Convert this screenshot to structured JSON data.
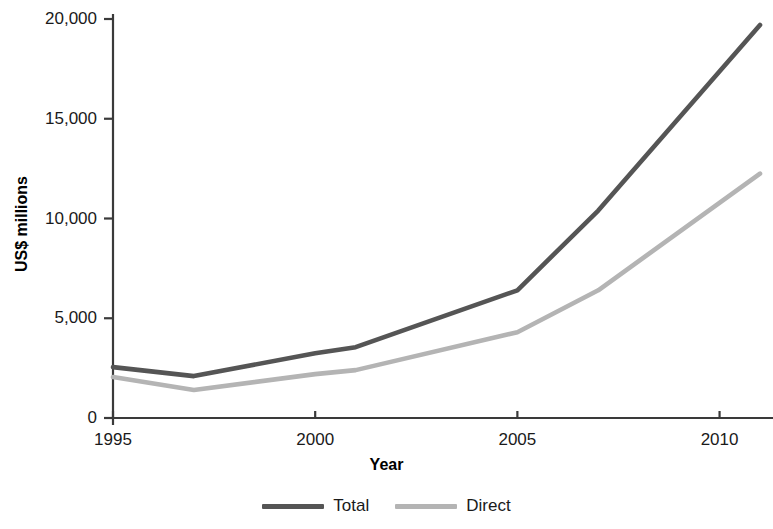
{
  "chart_data": {
    "type": "line",
    "title": "",
    "xlabel": "Year",
    "ylabel": "US$ millions",
    "xlim": [
      1995,
      2011
    ],
    "ylim": [
      0,
      20000
    ],
    "grid": false,
    "legend_position": "bottom-center",
    "x_ticks": [
      "1995",
      "2000",
      "2005",
      "2010"
    ],
    "x_tick_values": [
      1995,
      2000,
      2005,
      2010
    ],
    "y_ticks": [
      "0",
      "5,000",
      "10,000",
      "15,000",
      "20,000"
    ],
    "y_tick_values": [
      0,
      5000,
      10000,
      15000,
      20000
    ],
    "x": [
      1995,
      1997,
      2000,
      2001,
      2005,
      2007,
      2011
    ],
    "series": [
      {
        "name": "Total",
        "color": "#555555",
        "values": [
          2550,
          2100,
          3250,
          3550,
          6400,
          10400,
          19700
        ]
      },
      {
        "name": "Direct",
        "color": "#b4b4b4",
        "values": [
          2050,
          1400,
          2200,
          2400,
          4300,
          6400,
          12250
        ]
      }
    ]
  },
  "axes": {
    "y_title": "US$ millions",
    "x_title": "Year",
    "y_tick_labels": [
      "20,000",
      "15,000",
      "10,000",
      "5,000",
      "0"
    ],
    "x_tick_labels": [
      "1995",
      "2000",
      "2005",
      "2010"
    ]
  },
  "legend": {
    "items": [
      {
        "label": "Total",
        "color": "#555555"
      },
      {
        "label": "Direct",
        "color": "#b4b4b4"
      }
    ]
  },
  "colors": {
    "axis": "#3a3a3a",
    "text": "#1a1a1a",
    "background": "#ffffff",
    "total_line": "#555555",
    "direct_line": "#b4b4b4"
  }
}
